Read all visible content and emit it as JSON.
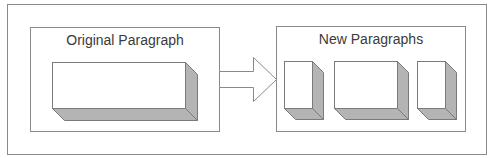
{
  "diagram": {
    "left_panel": {
      "title": "Original Paragraph"
    },
    "right_panel": {
      "title": "New Paragraphs"
    },
    "arrow": {
      "direction": "right"
    },
    "colors": {
      "stroke": "#7a7a7a",
      "face": "#ffffff",
      "shade": "#b4b4b4",
      "text": "#3a3a3a"
    },
    "blocks": {
      "original": 1,
      "new": 3
    }
  }
}
